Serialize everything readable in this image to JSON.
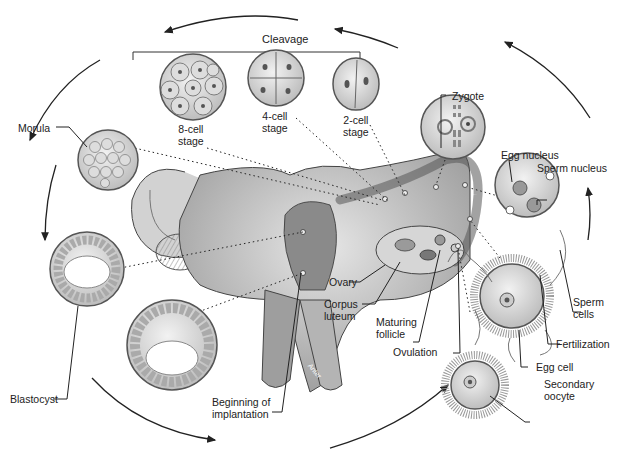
{
  "diagram": {
    "top_label": "Cleavage",
    "small_organ_label": "Anter",
    "stages": [
      {
        "id": "secondary-oocyte",
        "label": "Secondary\noocyte"
      },
      {
        "id": "egg-cell",
        "label": "Egg cell"
      },
      {
        "id": "fertilization",
        "label": "Fertilization"
      },
      {
        "id": "sperm-cells",
        "label": "Sperm\ncells"
      },
      {
        "id": "egg-nucleus",
        "label": "Egg nucleus"
      },
      {
        "id": "sperm-nucleus",
        "label": "Sperm nucleus"
      },
      {
        "id": "zygote",
        "label": "Zygote"
      },
      {
        "id": "two-cell",
        "label": "2-cell\nstage"
      },
      {
        "id": "four-cell",
        "label": "4-cell\nstage"
      },
      {
        "id": "eight-cell",
        "label": "8-cell\nstage"
      },
      {
        "id": "morula",
        "label": "Morula"
      },
      {
        "id": "blastocyst",
        "label": "Blastocyst"
      },
      {
        "id": "implantation",
        "label": "Beginning of\nimplantation"
      }
    ],
    "anatomy_labels": [
      {
        "id": "ovary",
        "label": "Ovary"
      },
      {
        "id": "corpus-luteum",
        "label": "Corpus\nluteum"
      },
      {
        "id": "maturing-follicle",
        "label": "Maturing\nfollicle"
      },
      {
        "id": "ovulation",
        "label": "Ovulation"
      }
    ],
    "colors": {
      "line": "#222222",
      "tissue_dark": "#7a7a7a",
      "tissue_mid": "#b5b5b5",
      "tissue_light": "#e2e2e2",
      "background": "#ffffff"
    }
  }
}
